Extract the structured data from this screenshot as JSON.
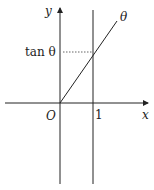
{
  "diagram": {
    "labels": {
      "y_axis": "y",
      "x_axis": "x",
      "origin": "O",
      "one": "1",
      "theta": "θ",
      "tan_theta": "tan θ"
    },
    "colors": {
      "line": "#222222",
      "background": "#ffffff"
    }
  }
}
